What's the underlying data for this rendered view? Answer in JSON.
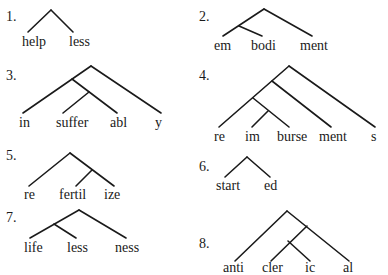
{
  "trees": [
    {
      "number": "1.",
      "word": "helpless",
      "morphemes": [
        "help",
        "less"
      ],
      "structure": "[help less]"
    },
    {
      "number": "2.",
      "word": "embodiment",
      "morphemes": [
        "em",
        "bodi",
        "ment"
      ],
      "structure": "[[em bodi] ment]"
    },
    {
      "number": "3.",
      "word": "insufferably",
      "morphemes": [
        "in",
        "suffer",
        "abl",
        "y"
      ],
      "structure": "[[in [suffer abl]] y]"
    },
    {
      "number": "4.",
      "word": "reimbursements",
      "morphemes": [
        "re",
        "im",
        "burse",
        "ment",
        "s"
      ],
      "structure": "[[[re [im burse]] ment] s]"
    },
    {
      "number": "5.",
      "word": "refertilize",
      "morphemes": [
        "re",
        "fertil",
        "ize"
      ],
      "structure": "[re [fertil ize]]"
    },
    {
      "number": "6.",
      "word": "started",
      "morphemes": [
        "start",
        "ed"
      ],
      "structure": "[start ed]"
    },
    {
      "number": "7.",
      "word": "lifelessness",
      "morphemes": [
        "life",
        "less",
        "ness"
      ],
      "structure": "[[life less] ness]"
    },
    {
      "number": "8.",
      "word": "anticlerical",
      "morphemes": [
        "anti",
        "cler",
        "ic",
        "al"
      ],
      "structure": "[anti [[cler ic] al]]"
    }
  ],
  "colors": {
    "ink": "#1a1a1a",
    "background": "#ffffff"
  }
}
